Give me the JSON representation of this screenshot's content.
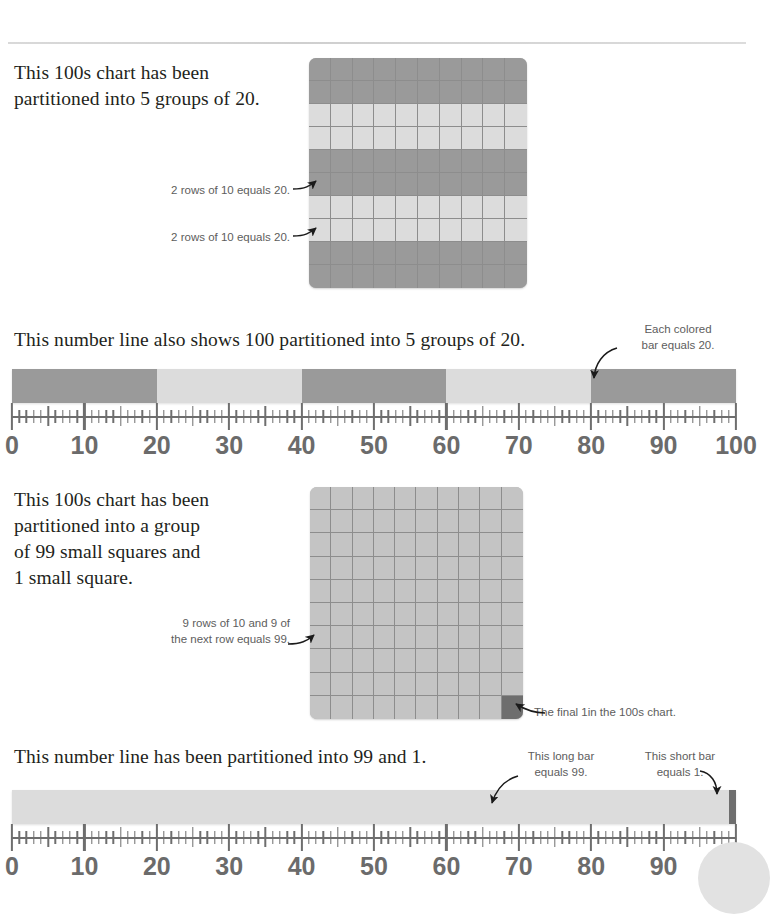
{
  "page": {
    "width": 754,
    "height": 896,
    "background": "#ffffff"
  },
  "colors": {
    "dark_band": "#9a9a9a",
    "light_band": "#dcdcdc",
    "chart_fill_dark": "#9a9a9a",
    "chart_fill_light": "#dcdcdc",
    "chart_uniform": "#c4c4c4",
    "final_one_cell": "#6e6e6e",
    "grid_line": "#8d8d8d",
    "text_body": "#231f20",
    "text_callout": "#5d5d5d",
    "axis": "#6e6e6e",
    "label": "#6b6b6b",
    "rule": "#d9d9d9"
  },
  "sections": [
    {
      "id": "section-1",
      "prose": "This 100s chart has been partitioned into 5 groups of 20.",
      "prose_lines": [
        "This 100s chart has been",
        "partitioned into 5 groups of 20."
      ],
      "callouts": [
        {
          "id": "callout-1a",
          "text": "2 rows of 10 equals 20."
        },
        {
          "id": "callout-1b",
          "text": "2 rows of 10 equals 20."
        }
      ],
      "chart": {
        "type": "hundreds-chart",
        "rows": 10,
        "cols": 10,
        "row_shading": [
          "dark",
          "dark",
          "light",
          "light",
          "dark",
          "dark",
          "light",
          "light",
          "dark",
          "dark"
        ]
      }
    },
    {
      "id": "section-2",
      "prose": "This number line also shows 100 partitioned into 5 groups of 20.",
      "prose_lines": [
        "This number line also shows 100 partitioned into 5 groups of 20."
      ],
      "callouts": [
        {
          "id": "callout-2a",
          "text_lines": [
            "Each colored",
            "bar equals 20."
          ]
        }
      ],
      "numberline": {
        "min": 0,
        "max": 100,
        "major_step": 10,
        "mid_step": 5,
        "minor_step": 1,
        "tick_labels": [
          "0",
          "10",
          "20",
          "30",
          "40",
          "50",
          "60",
          "70",
          "80",
          "90",
          "100"
        ],
        "segments": [
          {
            "from": 0,
            "to": 20,
            "shade": "dark",
            "value": 20
          },
          {
            "from": 20,
            "to": 40,
            "shade": "light",
            "value": 20
          },
          {
            "from": 40,
            "to": 60,
            "shade": "dark",
            "value": 20
          },
          {
            "from": 60,
            "to": 80,
            "shade": "light",
            "value": 20
          },
          {
            "from": 80,
            "to": 100,
            "shade": "dark",
            "value": 20
          }
        ]
      }
    },
    {
      "id": "section-3",
      "prose": "This 100s chart has been partitioned into a group of 99 small squares and 1 small square.",
      "prose_lines": [
        "This 100s chart has been",
        "partitioned into a group",
        "of 99 small squares and",
        "1 small square."
      ],
      "callouts": [
        {
          "id": "callout-3a",
          "text_lines": [
            "9 rows of 10 and 9 of",
            "the next row equals 99."
          ]
        },
        {
          "id": "callout-3b",
          "text": "The final 1in the 100s chart."
        }
      ],
      "chart": {
        "type": "hundreds-chart",
        "rows": 10,
        "cols": 10,
        "row_shading": [
          "uniform",
          "uniform",
          "uniform",
          "uniform",
          "uniform",
          "uniform",
          "uniform",
          "uniform",
          "uniform",
          "uniform"
        ],
        "highlight_cell": {
          "row": 10,
          "col": 10,
          "shade": "final_one"
        }
      }
    },
    {
      "id": "section-4",
      "prose": "This number line has been partitioned into 99 and 1.",
      "prose_lines": [
        "This number line has been partitioned into 99 and 1."
      ],
      "callouts": [
        {
          "id": "callout-4a",
          "text_lines": [
            "This long bar",
            "equals 99."
          ]
        },
        {
          "id": "callout-4b",
          "text_lines": [
            "This short bar",
            "equals 1."
          ]
        }
      ],
      "numberline": {
        "min": 0,
        "max": 100,
        "major_step": 10,
        "mid_step": 5,
        "minor_step": 1,
        "tick_labels": [
          "0",
          "10",
          "20",
          "30",
          "40",
          "50",
          "60",
          "70",
          "80",
          "90",
          "100"
        ],
        "segments": [
          {
            "from": 0,
            "to": 99,
            "shade": "light",
            "value": 99
          },
          {
            "from": 99,
            "to": 100,
            "shade": "final_one",
            "value": 1
          }
        ]
      }
    }
  ],
  "chart_data": {
    "type": "bar",
    "charts": [
      {
        "id": "hundreds-chart-5x20",
        "type": "heatmap",
        "rows": 10,
        "cols": 10,
        "total": 100,
        "groups": 5,
        "group_size": 20,
        "categories": [
          "rows 1-2",
          "rows 3-4",
          "rows 5-6",
          "rows 7-8",
          "rows 9-10"
        ],
        "values": [
          20,
          20,
          20,
          20,
          20
        ],
        "shades": [
          "dark",
          "light",
          "dark",
          "light",
          "dark"
        ]
      },
      {
        "id": "numberline-5x20",
        "type": "bar",
        "orientation": "horizontal",
        "xlim": [
          0,
          100
        ],
        "xlabel": "",
        "categories": [
          "0-20",
          "20-40",
          "40-60",
          "60-80",
          "80-100"
        ],
        "values": [
          20,
          20,
          20,
          20,
          20
        ],
        "shades": [
          "dark",
          "light",
          "dark",
          "light",
          "dark"
        ],
        "tick_labels": [
          0,
          10,
          20,
          30,
          40,
          50,
          60,
          70,
          80,
          90,
          100
        ],
        "minor_tick_step": 1,
        "mid_tick_step": 5,
        "grid": false
      },
      {
        "id": "hundreds-chart-99-1",
        "type": "heatmap",
        "rows": 10,
        "cols": 10,
        "total": 100,
        "groups": 2,
        "categories": [
          "99 small squares",
          "1 small square"
        ],
        "values": [
          99,
          1
        ],
        "shades": [
          "uniform",
          "final_one"
        ]
      },
      {
        "id": "numberline-99-1",
        "type": "bar",
        "orientation": "horizontal",
        "xlim": [
          0,
          100
        ],
        "xlabel": "",
        "categories": [
          "0-99",
          "99-100"
        ],
        "values": [
          99,
          1
        ],
        "shades": [
          "light",
          "final_one"
        ],
        "tick_labels": [
          0,
          10,
          20,
          30,
          40,
          50,
          60,
          70,
          80,
          90,
          100
        ],
        "minor_tick_step": 1,
        "mid_tick_step": 5,
        "grid": false
      }
    ]
  }
}
